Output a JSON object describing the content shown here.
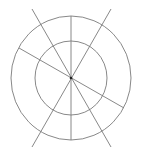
{
  "diagram": {
    "background": "#ffffff",
    "stroke_color": "#7a7a7a",
    "center_dot_color": "#222222",
    "center": {
      "x": 71,
      "y": 78
    },
    "circles": [
      {
        "name": "outer-circle",
        "cx": 71,
        "cy": 78,
        "rx": 60,
        "ry": 62
      },
      {
        "name": "inner-circle",
        "cx": 71,
        "cy": 78,
        "rx": 36,
        "ry": 37
      }
    ],
    "lines": [
      {
        "name": "vertical-line",
        "x1": 71,
        "y1": 16,
        "x2": 71,
        "y2": 140
      },
      {
        "name": "diagonal-line-top-left-to-bottom-right",
        "x1": 32,
        "y1": 9,
        "x2": 111,
        "y2": 147
      },
      {
        "name": "diagonal-line-top-right-to-bottom-left",
        "x1": 111,
        "y1": 9,
        "x2": 32,
        "y2": 147
      },
      {
        "name": "oblique-line-left-to-right",
        "x1": 19,
        "y1": 48,
        "x2": 124,
        "y2": 108
      }
    ]
  }
}
